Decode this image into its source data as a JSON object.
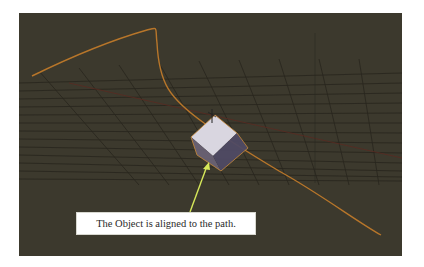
{
  "viewport": {
    "name": "3D viewport",
    "background_color": "#3c392d",
    "grid_color": "#262419",
    "path_color": "#b8762a",
    "object": {
      "name": "cube",
      "top_face_color": "#d9d6e0",
      "side_face_color": "#5b5570",
      "outline_color": "#c98a3a"
    }
  },
  "annotation": {
    "text": "The Object is aligned to the path.",
    "arrow_color": "#d6e85a"
  }
}
